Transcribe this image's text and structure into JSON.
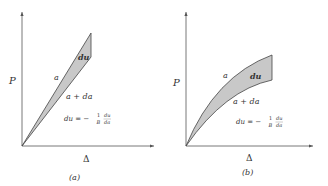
{
  "panels": [
    {
      "id": "a",
      "caption": "(a)",
      "y_axis_label": "P",
      "x_axis_label": "Δ",
      "curve_upper_label": "a",
      "curve_lower_label": "a + da",
      "area_label": "du",
      "formula": {
        "lhs": "du = −",
        "num1": "1",
        "den1": "B",
        "num2": "du",
        "den2": "da"
      },
      "shape": "linear"
    },
    {
      "id": "b",
      "caption": "(b)",
      "y_axis_label": "P",
      "x_axis_label": "Δ",
      "curve_upper_label": "a",
      "curve_lower_label": "a + da",
      "area_label": "du",
      "formula": {
        "lhs": "du = −",
        "num1": "1",
        "den1": "B",
        "num2": "du",
        "den2": "da"
      },
      "shape": "nonlinear"
    }
  ],
  "colors": {
    "axis": "#555555",
    "fill": "#c8c8c8",
    "stroke": "#444444",
    "text": "#333333"
  }
}
